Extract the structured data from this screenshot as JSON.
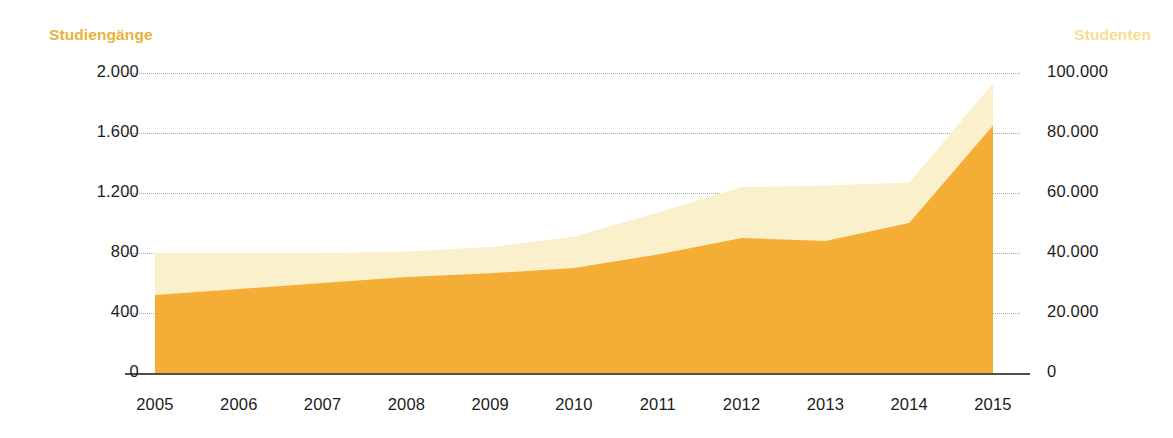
{
  "chart_data": {
    "type": "area",
    "title": "",
    "subtitle": "",
    "xlabel": "",
    "ylabel": "Studiengänge",
    "y2label": "Studenten",
    "categories": [
      "2005",
      "2006",
      "2007",
      "2008",
      "2009",
      "2010",
      "2011",
      "2012",
      "2013",
      "2014",
      "2015"
    ],
    "x_tick_labels": [
      "2005",
      "2006",
      "2007",
      "2008",
      "2009",
      "2010",
      "2011",
      "2012",
      "2013",
      "2014",
      "2015"
    ],
    "y_tick_labels": [
      "0",
      "400",
      "800",
      "1.200",
      "1.600",
      "2.000"
    ],
    "y_tick_values": [
      0,
      400,
      800,
      1200,
      1600,
      2000
    ],
    "ylim": [
      0,
      2000
    ],
    "y2_tick_labels": [
      "0",
      "20.000",
      "40.000",
      "60.000",
      "80.000",
      "100.000"
    ],
    "y2_tick_values": [
      0,
      20000,
      40000,
      60000,
      80000,
      100000
    ],
    "y2lim": [
      0,
      100000
    ],
    "grid": true,
    "legend_position": "axis-titles",
    "series": [
      {
        "name": "Studiengänge",
        "axis": "left",
        "color": "#F5AE35",
        "values": [
          520,
          560,
          600,
          640,
          665,
          700,
          790,
          900,
          880,
          1000,
          1650
        ]
      },
      {
        "name": "Studenten",
        "axis": "right",
        "color": "#FAF1CC",
        "values": [
          40000,
          40000,
          40000,
          40500,
          42000,
          45500,
          53500,
          62000,
          62500,
          63500,
          96500
        ],
        "values_left_scale": [
          800,
          800,
          800,
          810,
          840,
          910,
          1070,
          1240,
          1250,
          1270,
          1930
        ]
      }
    ],
    "colors": {
      "studiengaenge": "#F5AE35",
      "studenten": "#FAF1CC",
      "title_left": "#E9B23D",
      "title_right": "#F7DE91",
      "axis": "#4F4F4D",
      "grid": "#9A9A96",
      "tick_text": "#1C1C1C",
      "background": "#FFFFFF"
    }
  },
  "labels": {
    "axis_title_left": "Studiengänge",
    "axis_title_right": "Studenten"
  }
}
